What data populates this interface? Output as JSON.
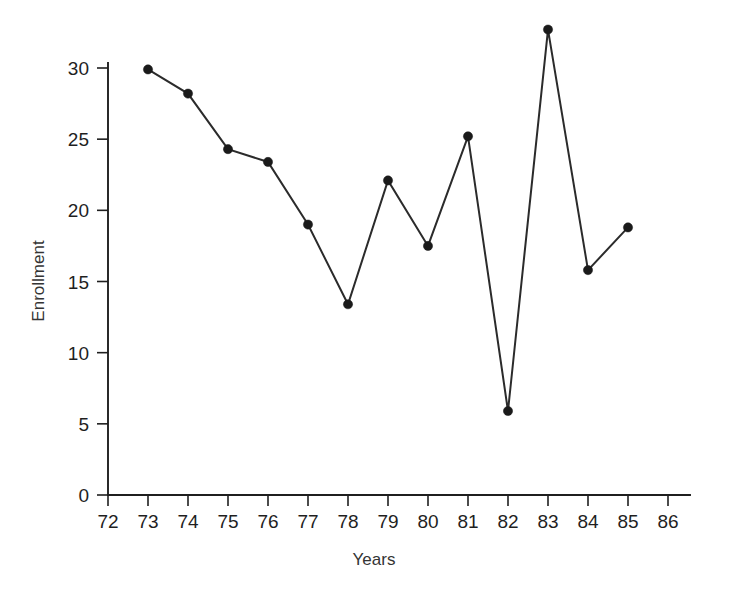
{
  "chart_data": {
    "type": "line",
    "title": "",
    "xlabel": "Years",
    "ylabel": "Enrollment",
    "x": [
      73,
      74,
      75,
      76,
      77,
      78,
      79,
      80,
      81,
      82,
      83,
      84,
      85
    ],
    "values": [
      29.9,
      28.2,
      24.3,
      23.4,
      19.0,
      13.4,
      22.1,
      17.5,
      25.2,
      5.9,
      32.7,
      15.8,
      18.8
    ],
    "series": [
      {
        "name": "Enrollment",
        "values": [
          29.9,
          28.2,
          24.3,
          23.4,
          19.0,
          13.4,
          22.1,
          17.5,
          25.2,
          5.9,
          32.7,
          15.8,
          18.8
        ]
      }
    ],
    "xlim": [
      72,
      86
    ],
    "ylim": [
      0,
      30
    ],
    "x_tick_labels": [
      "72",
      "73",
      "74",
      "75",
      "76",
      "77",
      "78",
      "79",
      "80",
      "81",
      "82",
      "83",
      "84",
      "85",
      "86"
    ],
    "x_ticks": [
      72,
      73,
      74,
      75,
      76,
      77,
      78,
      79,
      80,
      81,
      82,
      83,
      84,
      85,
      86
    ],
    "y_tick_labels": [
      "0",
      "5",
      "10",
      "15",
      "20",
      "25",
      "30"
    ],
    "y_ticks": [
      0,
      5,
      10,
      15,
      20,
      25,
      30
    ],
    "grid": false,
    "legend": false,
    "legend_position": "none",
    "marker": "circle",
    "line_color": "#2b2b2b",
    "marker_color": "#1a1a1a",
    "background_color": "#ffffff"
  },
  "axis_labels": {
    "x_title": "Years",
    "y_title": "Enrollment"
  }
}
